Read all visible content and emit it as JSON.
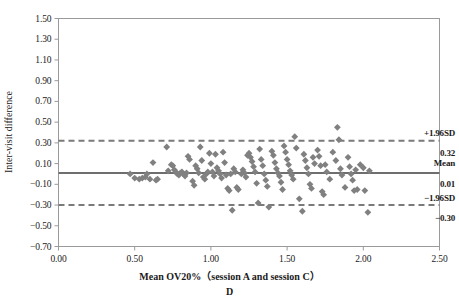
{
  "figure": {
    "panel_letter": "D",
    "xlabel": "Mean OV20%（session A and session C）",
    "ylabel": "Inter-visit difference"
  },
  "annotations": {
    "upper_label": "+1.96SD",
    "upper_value": "0.32",
    "mean_label": "Mean",
    "mean_value": "0.01",
    "lower_label": "−1.96SD",
    "lower_value": "−0.30"
  },
  "colors": {
    "marker": "#808080",
    "mean_line": "#6e6e6e",
    "limit_line": "#7a7a7a",
    "frame": "#9a9a9a",
    "text": "#1a1a1a"
  },
  "chart_data": {
    "type": "scatter",
    "title": "",
    "subtitle": "",
    "xlabel": "Mean OV20%（session A and session C）",
    "ylabel": "Inter-visit difference",
    "xlim": [
      0.0,
      2.5
    ],
    "ylim": [
      -0.7,
      1.5
    ],
    "xticks": [
      "0.00",
      "0.50",
      "1.00",
      "1.50",
      "2.00",
      "2.50"
    ],
    "xtick_values": [
      0.0,
      0.5,
      1.0,
      1.5,
      2.0,
      2.5
    ],
    "yticks": [
      "1.50",
      "1.30",
      "1.10",
      "0.90",
      "0.70",
      "0.50",
      "0.30",
      "0.10",
      "−0.10",
      "−0.30",
      "−0.50",
      "−0.70"
    ],
    "ytick_values": [
      1.5,
      1.3,
      1.1,
      0.9,
      0.7,
      0.5,
      0.3,
      0.1,
      -0.1,
      -0.3,
      -0.5,
      -0.7
    ],
    "grid": false,
    "legend": "none",
    "marker_shape": "diamond",
    "reference_lines": [
      {
        "name": "upper_limit_of_agreement",
        "label": "+1.96SD",
        "value": 0.32,
        "style": "dashed"
      },
      {
        "name": "mean_difference",
        "label": "Mean",
        "value": 0.01,
        "style": "solid"
      },
      {
        "name": "lower_limit_of_agreement",
        "label": "−1.96SD",
        "value": -0.3,
        "style": "dashed"
      }
    ],
    "series": [
      {
        "name": "Inter-visit difference vs mean OV20%",
        "x": [
          0.47,
          0.5,
          0.53,
          0.55,
          0.57,
          0.58,
          0.6,
          0.62,
          0.64,
          0.65,
          0.71,
          0.72,
          0.74,
          0.75,
          0.76,
          0.77,
          0.78,
          0.79,
          0.8,
          0.81,
          0.82,
          0.83,
          0.84,
          0.85,
          0.86,
          0.88,
          0.89,
          0.9,
          0.91,
          0.92,
          0.93,
          0.94,
          0.95,
          0.96,
          0.97,
          0.98,
          0.99,
          1.0,
          1.01,
          1.02,
          1.03,
          1.04,
          1.05,
          1.06,
          1.07,
          1.08,
          1.09,
          1.1,
          1.11,
          1.12,
          1.13,
          1.14,
          1.15,
          1.16,
          1.17,
          1.18,
          1.2,
          1.21,
          1.22,
          1.23,
          1.24,
          1.25,
          1.26,
          1.27,
          1.28,
          1.29,
          1.3,
          1.31,
          1.32,
          1.33,
          1.34,
          1.35,
          1.36,
          1.37,
          1.38,
          1.4,
          1.41,
          1.42,
          1.43,
          1.44,
          1.45,
          1.46,
          1.47,
          1.48,
          1.49,
          1.5,
          1.51,
          1.52,
          1.53,
          1.54,
          1.55,
          1.56,
          1.58,
          1.6,
          1.61,
          1.62,
          1.63,
          1.64,
          1.65,
          1.66,
          1.67,
          1.68,
          1.7,
          1.71,
          1.72,
          1.73,
          1.74,
          1.75,
          1.76,
          1.78,
          1.8,
          1.82,
          1.83,
          1.84,
          1.85,
          1.86,
          1.88,
          1.9,
          1.91,
          1.92,
          1.93,
          1.94,
          1.95,
          1.96,
          1.98,
          2.0,
          2.01,
          2.03,
          2.04
        ],
        "y": [
          0.0,
          -0.04,
          -0.05,
          -0.04,
          -0.03,
          0.0,
          -0.05,
          0.11,
          -0.06,
          -0.05,
          0.26,
          0.03,
          0.09,
          0.08,
          0.04,
          0.02,
          0.0,
          -0.01,
          0.01,
          0.02,
          0.0,
          -0.02,
          0.01,
          0.17,
          0.14,
          -0.07,
          -0.11,
          0.08,
          0.05,
          0.01,
          0.26,
          0.13,
          -0.03,
          -0.05,
          0.0,
          0.02,
          0.2,
          0.1,
          0.02,
          -0.02,
          0.19,
          0.06,
          0.03,
          0.0,
          -0.04,
          0.21,
          0.11,
          -0.01,
          -0.14,
          -0.16,
          0.0,
          -0.35,
          0.05,
          0.02,
          -0.13,
          -0.15,
          0.0,
          0.04,
          0.01,
          -0.03,
          0.18,
          0.2,
          0.16,
          0.12,
          0.07,
          0.02,
          -0.09,
          -0.28,
          0.24,
          0.14,
          0.08,
          0.0,
          -0.06,
          -0.12,
          -0.32,
          0.22,
          0.18,
          0.11,
          0.05,
          0.01,
          -0.02,
          -0.08,
          -0.15,
          0.27,
          0.21,
          0.14,
          0.09,
          0.03,
          -0.01,
          -0.05,
          0.36,
          0.25,
          -0.24,
          -0.36,
          0.19,
          0.13,
          0.06,
          0.0,
          -0.1,
          -0.14,
          0.16,
          0.1,
          0.23,
          0.17,
          0.08,
          -0.17,
          -0.2,
          0.09,
          0.02,
          -0.05,
          0.21,
          0.13,
          0.45,
          0.33,
          0.05,
          -0.01,
          -0.13,
          0.16,
          0.07,
          0.0,
          -0.06,
          -0.16,
          0.04,
          -0.15,
          0.09,
          0.06,
          -0.16,
          -0.37,
          0.03
        ]
      }
    ]
  }
}
